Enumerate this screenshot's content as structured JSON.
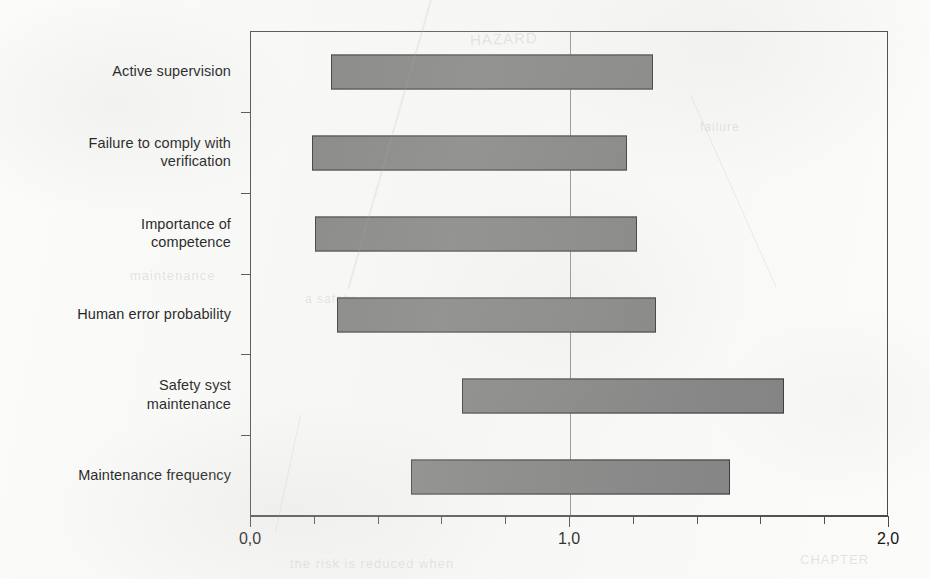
{
  "chart_data": {
    "type": "bar",
    "subtype": "horizontal-range-bar",
    "title": "",
    "xlabel": "",
    "ylabel": "",
    "xlim": [
      0.0,
      2.0
    ],
    "grid": false,
    "legend": null,
    "reference_line": 1.0,
    "categories": [
      "Active supervision",
      "Failure to comply with verification",
      "Importance of competence",
      "Human error probability",
      "Safety syst maintenance",
      "Maintenance frequency"
    ],
    "category_lines": [
      [
        "Active supervision"
      ],
      [
        "Failure to comply with",
        "verification"
      ],
      [
        "Importance of",
        "competence"
      ],
      [
        "Human error probability"
      ],
      [
        "Safety syst",
        "maintenance"
      ],
      [
        "Maintenance frequency"
      ]
    ],
    "series": [
      {
        "name": "range",
        "low": [
          0.25,
          0.19,
          0.2,
          0.27,
          0.66,
          0.5
        ],
        "high": [
          1.26,
          1.18,
          1.21,
          1.27,
          1.67,
          1.5
        ]
      }
    ],
    "xticks": [
      0.0,
      0.2,
      0.4,
      0.6,
      0.8,
      1.0,
      1.2,
      1.4,
      1.6,
      1.8,
      2.0
    ],
    "xticklabels_shown": [
      {
        "value": 0.0,
        "label": "0,0"
      },
      {
        "value": 1.0,
        "label": "1,0"
      },
      {
        "value": 2.0,
        "label": "2,0"
      }
    ],
    "colors": {
      "bar_fill": "#7d7d7d",
      "bar_border": "#2f2f2f",
      "axis": "#4a4a4a",
      "gridline": "#8d8d8d",
      "text": "#141414",
      "background": "#fbfbfa"
    }
  },
  "ghost_text": [
    {
      "text": "HAZARD",
      "x": 470,
      "y": 30,
      "rot": -2,
      "size": 15
    },
    {
      "text": "maintenance",
      "x": 130,
      "y": 268,
      "rot": 0,
      "size": 13
    },
    {
      "text": "a safety",
      "x": 305,
      "y": 292,
      "rot": 0,
      "size": 12
    },
    {
      "text": "failure",
      "x": 700,
      "y": 120,
      "rot": 0,
      "size": 12
    },
    {
      "text": "the risk is reduced when",
      "x": 290,
      "y": 556,
      "rot": 0,
      "size": 13
    },
    {
      "text": "CHAPTER",
      "x": 800,
      "y": 552,
      "rot": 0,
      "size": 13
    }
  ]
}
